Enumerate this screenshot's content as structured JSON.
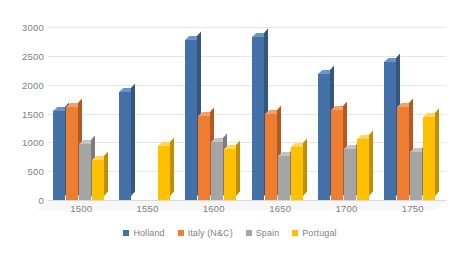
{
  "chart_data": {
    "type": "bar",
    "title": "",
    "subtitle": "",
    "xlabel": "",
    "ylabel": "",
    "categories": [
      "1500",
      "1550",
      "1600",
      "1650",
      "1700",
      "1750"
    ],
    "series": [
      {
        "name": "Holland",
        "color": "#4472a8",
        "values": [
          1540,
          1880,
          2780,
          2820,
          2180,
          2390
        ]
      },
      {
        "name": "Italy (N&C)",
        "color": "#ed7d31",
        "values": [
          1620,
          null,
          1460,
          1490,
          1560,
          1610
        ]
      },
      {
        "name": "Spain",
        "color": "#a5a5a5",
        "values": [
          980,
          null,
          1000,
          770,
          890,
          840
        ]
      },
      {
        "name": "Portugal",
        "color": "#ffc000",
        "values": [
          700,
          930,
          890,
          920,
          1060,
          1440
        ]
      }
    ],
    "ylim": [
      0,
      3000
    ],
    "yticks": [
      0,
      500,
      1000,
      1500,
      2000,
      2500,
      3000
    ],
    "ytick_labels": [
      "0",
      "500",
      "1000",
      "1500",
      "2000",
      "2500",
      "3000"
    ],
    "grid": true,
    "legend_position": "bottom",
    "style": "3d-clustered-column"
  },
  "legend": {
    "items": [
      {
        "label": "Holland"
      },
      {
        "label": "Italy (N&C)"
      },
      {
        "label": "Spain"
      },
      {
        "label": "Portugal"
      }
    ]
  }
}
